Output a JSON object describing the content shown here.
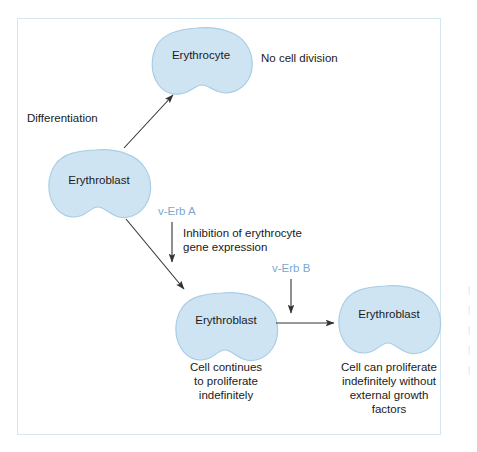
{
  "figure": {
    "background_color": "#ffffff",
    "frame_border_color": "#d5e7f0",
    "cell_fill_color": "#cfe4f2",
    "cell_stroke_color": "#a8cde4",
    "arrow_color": "#333333",
    "text_color": "#1a1a1a",
    "gene_label_color": "#7aa9cf"
  },
  "cells": {
    "erythrocyte_top": {
      "label": "Erythrocyte"
    },
    "erythroblast_left": {
      "label": "Erythroblast"
    },
    "erythroblast_middle": {
      "label": "Erythroblast"
    },
    "erythroblast_right": {
      "label": "Erythroblast"
    }
  },
  "labels": {
    "differentiation": "Differentiation",
    "no_cell_division": "No cell division",
    "v_erb_a": "v-Erb A",
    "v_erb_b": "v-Erb B",
    "inhibition_line1": "Inhibition of erythrocyte",
    "inhibition_line2": "gene expression"
  },
  "captions": {
    "middle_cell": {
      "line1": "Cell continues",
      "line2": "to proliferate",
      "line3": "indefinitely"
    },
    "right_cell": {
      "line1": "Cell can proliferate",
      "line2": "indefinitely without",
      "line3": "external growth",
      "line4": "factors"
    }
  },
  "edge_fragments": {
    "f1": "|",
    "f2": "|",
    "f3": "|",
    "f4": "|",
    "f5": "|"
  },
  "icons": {
    "arrow_head": "arrowhead-icon",
    "cell_blob": "cell-blob-icon"
  }
}
